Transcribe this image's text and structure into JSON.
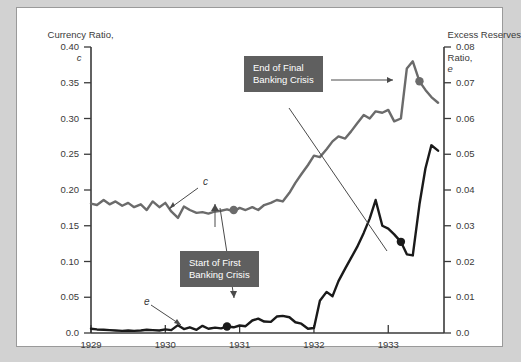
{
  "axes": {
    "left": {
      "title_line1": "Currency Ratio,",
      "title_symbol": "c",
      "ticks": [
        "0.40",
        "0.35",
        "0.30",
        "0.25",
        "0.20",
        "0.15",
        "0.10",
        "0.05",
        "0.0"
      ]
    },
    "right": {
      "title_line1": "Excess Reserves",
      "title_line2": "Ratio,",
      "title_symbol": "e",
      "ticks": [
        "0.08",
        "0.07",
        "0.06",
        "0.05",
        "0.04",
        "0.03",
        "0.02",
        "0.01",
        "0.0"
      ]
    },
    "bottom": {
      "ticks": [
        "1929",
        "1930",
        "1931",
        "1932",
        "1933"
      ]
    }
  },
  "annotations": {
    "end_crisis": "End of Final\nBanking Crisis",
    "start_crisis": "Start of First\nBanking Crisis"
  },
  "series_labels": {
    "currency": "c",
    "excess": "e"
  },
  "colors": {
    "currency_line": "#6b6b6b",
    "excess_line": "#1a1a1a",
    "annotation_box": "#5f5f5f",
    "panel": "#ffffff",
    "background": "#d2d2d2",
    "axis": "#3a3a3a"
  },
  "chart_data": {
    "type": "line",
    "title": "",
    "xlabel": "",
    "ylabel": "Currency Ratio, c",
    "y2label": "Excess Reserves Ratio, e",
    "xlim": [
      1929.0,
      1933.75
    ],
    "ylim": [
      0.0,
      0.4
    ],
    "y2lim": [
      0.0,
      0.08
    ],
    "grid": false,
    "legend": "inline-labels",
    "x": [
      1929.0,
      1929.08,
      1929.17,
      1929.25,
      1929.33,
      1929.42,
      1929.5,
      1929.58,
      1929.67,
      1929.75,
      1929.83,
      1929.92,
      1930.0,
      1930.08,
      1930.17,
      1930.25,
      1930.33,
      1930.42,
      1930.5,
      1930.58,
      1930.67,
      1930.75,
      1930.83,
      1930.92,
      1931.0,
      1931.08,
      1931.17,
      1931.25,
      1931.33,
      1931.42,
      1931.5,
      1931.58,
      1931.67,
      1931.75,
      1931.83,
      1931.92,
      1932.0,
      1932.08,
      1932.17,
      1932.25,
      1932.33,
      1932.42,
      1932.5,
      1932.58,
      1932.67,
      1932.75,
      1932.83,
      1932.92,
      1933.0,
      1933.08,
      1933.17,
      1933.25,
      1933.33,
      1933.42,
      1933.5,
      1933.58,
      1933.67
    ],
    "series": [
      {
        "name": "c",
        "axis": "left",
        "values": [
          0.181,
          0.179,
          0.186,
          0.18,
          0.184,
          0.178,
          0.182,
          0.176,
          0.18,
          0.172,
          0.184,
          0.176,
          0.182,
          0.17,
          0.161,
          0.177,
          0.172,
          0.168,
          0.169,
          0.167,
          0.17,
          0.171,
          0.173,
          0.17,
          0.175,
          0.172,
          0.176,
          0.172,
          0.179,
          0.182,
          0.186,
          0.184,
          0.196,
          0.21,
          0.222,
          0.235,
          0.248,
          0.246,
          0.257,
          0.268,
          0.275,
          0.272,
          0.282,
          0.293,
          0.305,
          0.3,
          0.31,
          0.308,
          0.312,
          0.296,
          0.3,
          0.37,
          0.38,
          0.352,
          0.34,
          0.33,
          0.322
        ]
      },
      {
        "name": "e",
        "axis": "right",
        "values": [
          0.0012,
          0.001,
          0.0009,
          0.0008,
          0.0007,
          0.0006,
          0.0007,
          0.0006,
          0.0007,
          0.0009,
          0.0008,
          0.0007,
          0.001,
          0.0008,
          0.0022,
          0.0011,
          0.0016,
          0.0009,
          0.002,
          0.0012,
          0.0015,
          0.0013,
          0.0018,
          0.0016,
          0.0021,
          0.0019,
          0.0035,
          0.004,
          0.0032,
          0.0031,
          0.0046,
          0.0048,
          0.0044,
          0.003,
          0.0026,
          0.0012,
          0.0014,
          0.009,
          0.0115,
          0.0103,
          0.0145,
          0.018,
          0.021,
          0.024,
          0.028,
          0.032,
          0.0372,
          0.03,
          0.0292,
          0.0276,
          0.0255,
          0.022,
          0.0217,
          0.036,
          0.046,
          0.0525,
          0.051
        ]
      }
    ],
    "markers": [
      {
        "series": "c",
        "x": 1930.92,
        "y": 0.172,
        "color": "#6b6b6b",
        "label": "Start of First Banking Crisis"
      },
      {
        "series": "c",
        "x": 1933.42,
        "y": 0.352,
        "color": "#6b6b6b",
        "label": "End of Final Banking Crisis"
      },
      {
        "series": "e",
        "x": 1930.83,
        "y": 0.0018,
        "color": "#1a1a1a",
        "label": "Start of First Banking Crisis"
      },
      {
        "series": "e",
        "x": 1933.17,
        "y": 0.0255,
        "color": "#1a1a1a",
        "label": "End of Final Banking Crisis"
      }
    ]
  }
}
